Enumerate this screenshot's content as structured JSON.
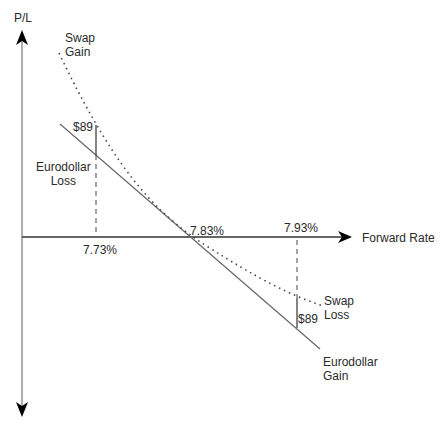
{
  "axes": {
    "y_label": "P/L",
    "x_label": "Forward Rate"
  },
  "labels": {
    "swap_gain": "Swap\nGain",
    "swap_loss": "Swap\nLoss",
    "eurodollar_loss": "Eurodollar\nLoss",
    "eurodollar_gain": "Eurodollar\nGain",
    "amount_left": "$89",
    "amount_right": "$89",
    "rate_low": "7.73%",
    "rate_mid": "7.83%",
    "rate_high": "7.93%"
  },
  "colors": {
    "axis": "#000000",
    "line": "#555555",
    "text": "#2a2a2a"
  }
}
